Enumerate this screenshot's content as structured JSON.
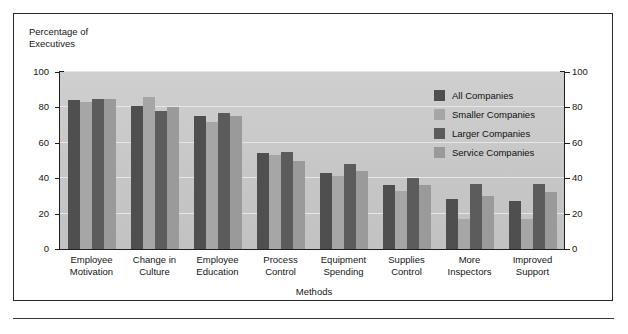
{
  "figure": {
    "ylabel": "Percentage of\nExecutives",
    "xlabel": "Methods"
  },
  "legend": {
    "items": [
      {
        "label": "All Companies",
        "color": "#4f4f4f"
      },
      {
        "label": "Smaller Companies",
        "color": "#a6a6a6"
      },
      {
        "label": "Larger Companies",
        "color": "#5c5c5c"
      },
      {
        "label": "Service Companies",
        "color": "#9a9a9a"
      }
    ]
  },
  "axis": {
    "left_ticks": [
      "100",
      "80",
      "60",
      "40",
      "20",
      "0"
    ],
    "right_ticks": [
      "100",
      "80",
      "60",
      "40",
      "20",
      "0"
    ]
  },
  "chart_data": {
    "type": "bar",
    "title": "",
    "subtitle": "",
    "xlabel": "Methods",
    "ylabel": "Percentage of Executives",
    "ylim": [
      0,
      100
    ],
    "yticks": [
      0,
      20,
      40,
      60,
      80,
      100
    ],
    "grid": true,
    "legend_position": "inside-top-right",
    "categories": [
      "Employee\nMotivation",
      "Change in\nCulture",
      "Employee\nEducation",
      "Process\nControl",
      "Equipment\nSpending",
      "Supplies\nControl",
      "More\nInspectors",
      "Improved\nSupport"
    ],
    "series": [
      {
        "name": "All Companies",
        "color": "#4f4f4f",
        "values": [
          84,
          81,
          75,
          54,
          43,
          36,
          28,
          27
        ]
      },
      {
        "name": "Smaller Companies",
        "color": "#a6a6a6",
        "values": [
          83,
          86,
          72,
          53,
          41,
          33,
          17,
          17
        ]
      },
      {
        "name": "Larger Companies",
        "color": "#5c5c5c",
        "values": [
          85,
          78,
          77,
          55,
          48,
          40,
          37,
          37
        ]
      },
      {
        "name": "Service Companies",
        "color": "#9a9a9a",
        "values": [
          85,
          80,
          75,
          50,
          44,
          36,
          30,
          32
        ]
      }
    ]
  },
  "colors": {
    "plot_background": "#c9c9c9",
    "gridline": "#e6e6e6",
    "axis": "#1f1f1f",
    "frame": "#2b2b2b"
  }
}
